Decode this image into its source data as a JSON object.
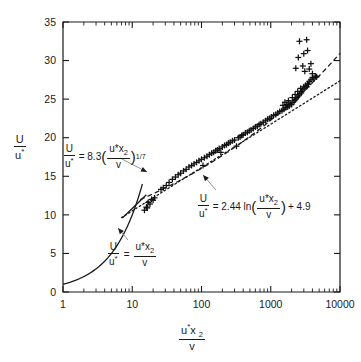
{
  "chart_data": {
    "type": "scatter",
    "title": "",
    "xlabel": "u*x2/v",
    "ylabel": "U/u*",
    "xscale": "log",
    "yscale": "linear",
    "xlim": [
      1,
      10000
    ],
    "ylim": [
      0,
      35
    ],
    "xticks": [
      1,
      10,
      100,
      1000,
      10000
    ],
    "xticklabels": [
      "1",
      "10",
      "100",
      "1000",
      "10000"
    ],
    "yticks": [
      0,
      5,
      10,
      15,
      20,
      25,
      30,
      35
    ],
    "yticklabels": [
      "0",
      "5",
      "10",
      "15",
      "20",
      "25",
      "30",
      "35"
    ],
    "grid": false,
    "legend": "none",
    "marker": "plus",
    "series": [
      {
        "name": "measured mean velocity profile",
        "marker": "+",
        "points": [
          [
            15,
            10.6
          ],
          [
            16,
            11.0
          ],
          [
            16.5,
            10.9
          ],
          [
            17,
            11.6
          ],
          [
            18,
            11.4
          ],
          [
            19,
            12.0
          ],
          [
            20,
            11.9
          ],
          [
            21,
            12.2
          ],
          [
            26,
            13.3
          ],
          [
            28,
            13.5
          ],
          [
            31,
            13.8
          ],
          [
            34,
            14.2
          ],
          [
            38,
            14.6
          ],
          [
            42,
            14.9
          ],
          [
            46,
            15.2
          ],
          [
            50,
            15.4
          ],
          [
            55,
            15.7
          ],
          [
            60,
            15.9
          ],
          [
            66,
            16.2
          ],
          [
            72,
            16.4
          ],
          [
            78,
            16.6
          ],
          [
            85,
            16.8
          ],
          [
            92,
            17.0
          ],
          [
            100,
            17.2
          ],
          [
            105,
            16.4
          ],
          [
            110,
            17.4
          ],
          [
            120,
            17.6
          ],
          [
            130,
            17.8
          ],
          [
            140,
            18.0
          ],
          [
            150,
            18.1
          ],
          [
            160,
            18.3
          ],
          [
            170,
            18.4
          ],
          [
            180,
            18.6
          ],
          [
            190,
            18.1
          ],
          [
            200,
            18.8
          ],
          [
            215,
            19.0
          ],
          [
            230,
            19.1
          ],
          [
            245,
            19.3
          ],
          [
            260,
            19.4
          ],
          [
            280,
            19.6
          ],
          [
            300,
            19.7
          ],
          [
            320,
            18.9
          ],
          [
            340,
            20.0
          ],
          [
            360,
            20.1
          ],
          [
            380,
            20.3
          ],
          [
            400,
            20.4
          ],
          [
            430,
            20.6
          ],
          [
            460,
            20.7
          ],
          [
            490,
            20.9
          ],
          [
            520,
            21.0
          ],
          [
            560,
            21.2
          ],
          [
            600,
            21.4
          ],
          [
            640,
            21.5
          ],
          [
            680,
            21.7
          ],
          [
            720,
            21.8
          ],
          [
            780,
            22.0
          ],
          [
            840,
            22.2
          ],
          [
            900,
            22.4
          ],
          [
            960,
            22.5
          ],
          [
            1020,
            22.7
          ],
          [
            1100,
            22.9
          ],
          [
            1180,
            23.0
          ],
          [
            1260,
            23.2
          ],
          [
            1350,
            23.4
          ],
          [
            1450,
            23.5
          ],
          [
            1500,
            24.2
          ],
          [
            1550,
            23.7
          ],
          [
            1600,
            24.6
          ],
          [
            1650,
            23.9
          ],
          [
            1700,
            24.3
          ],
          [
            1750,
            24.0
          ],
          [
            1800,
            24.8
          ],
          [
            1850,
            24.1
          ],
          [
            1900,
            24.5
          ],
          [
            2000,
            24.3
          ],
          [
            2050,
            25.2
          ],
          [
            2100,
            24.6
          ],
          [
            2200,
            24.8
          ],
          [
            2250,
            25.6
          ],
          [
            2300,
            25.0
          ],
          [
            2400,
            25.2
          ],
          [
            2450,
            26.0
          ],
          [
            2500,
            25.4
          ],
          [
            2600,
            25.6
          ],
          [
            2700,
            26.4
          ],
          [
            2750,
            25.8
          ],
          [
            2800,
            26.0
          ],
          [
            2900,
            26.2
          ],
          [
            3000,
            26.6
          ],
          [
            3100,
            26.4
          ],
          [
            3200,
            26.8
          ],
          [
            3300,
            26.6
          ],
          [
            3400,
            27.0
          ],
          [
            3500,
            26.9
          ],
          [
            3600,
            27.3
          ],
          [
            3800,
            27.5
          ],
          [
            4000,
            27.8
          ],
          [
            4200,
            27.6
          ],
          [
            4400,
            28.0
          ],
          [
            4600,
            27.9
          ],
          [
            2300,
            29.0
          ],
          [
            2500,
            30.4
          ],
          [
            2600,
            32.5
          ],
          [
            2900,
            29.3
          ],
          [
            3000,
            30.9
          ],
          [
            3100,
            28.6
          ],
          [
            3300,
            32.7
          ],
          [
            3400,
            31.3
          ],
          [
            3600,
            28.9
          ],
          [
            3800,
            29.6
          ],
          [
            4000,
            28.3
          ]
        ]
      }
    ],
    "curves": [
      {
        "name": "linear viscous sublayer",
        "style": "solid",
        "equation": "U/u* = u*x2/v",
        "x_range": [
          1,
          14
        ]
      },
      {
        "name": "power law one-seventh",
        "style": "dashed",
        "equation": "U/u* = 8.3 (u*x2/v)^(1/7)",
        "coefficient": 8.3,
        "exponent": 0.142857,
        "x_range": [
          13,
          10000
        ]
      },
      {
        "name": "logarithmic law of the wall",
        "style": "dotted",
        "equation": "U/u* = 2.44 ln(u*x2/v) + 4.9",
        "slope": 2.44,
        "intercept": 4.9,
        "x_range": [
          7,
          10000
        ]
      },
      {
        "name": "sublayer straight segment",
        "style": "solid",
        "x_range": [
          7.2,
          16
        ]
      }
    ],
    "annotations": [
      {
        "id": "power-law",
        "text": "U/u* = 8.3(u*x2/v)^1/7",
        "target_x": 22,
        "target_y": 13.4
      },
      {
        "id": "log-law",
        "text": "U/u* = 2.44 ln(u*x2/v) + 4.9",
        "target_x": 330,
        "target_y": 19.2
      },
      {
        "id": "sublayer",
        "text": "U/u* = u*x2/v",
        "target_x": 11,
        "target_y": 9.2
      }
    ]
  },
  "labels": {
    "y_numerator": "U",
    "y_denominator": "u",
    "y_star": "*",
    "x_numerator_u": "u",
    "x_numerator_star": "*",
    "x_numerator_x": "x",
    "x_numerator_sub": "2",
    "x_denominator": "v",
    "eq_power": {
      "lhs_num": "U",
      "lhs_den": "u",
      "equals": "= 8.3",
      "open": "(",
      "inner_num": "u*x",
      "inner_sub": "2",
      "inner_den": "v",
      "close": ")",
      "exponent": "1/7"
    },
    "eq_log": {
      "lhs_num": "U",
      "lhs_den": "u",
      "equals": "= 2.44 ln",
      "open": "(",
      "inner_num": "u*x",
      "inner_sub": "2",
      "inner_den": "v",
      "close": ")",
      "tail": "+ 4.9"
    },
    "eq_sublayer": {
      "lhs_num": "U",
      "lhs_den": "u",
      "equals": "=",
      "rhs_num": "u*x",
      "rhs_sub": "2",
      "rhs_den": "v"
    }
  },
  "colors": {
    "ink": "#1a1a1a",
    "marker": "#111111",
    "leader": "#8a8a8a",
    "background": "#ffffff"
  }
}
